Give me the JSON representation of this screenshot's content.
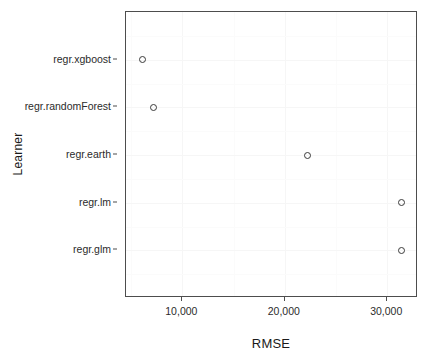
{
  "chart_data": {
    "type": "scatter",
    "title": "",
    "xlabel": "RMSE",
    "ylabel": "Learner",
    "grid": true,
    "legend": null,
    "xlim": [
      4500,
      33000
    ],
    "x_ticks": [
      10000,
      20000,
      30000
    ],
    "x_tick_labels": [
      "10,000",
      "20,000",
      "30,000"
    ],
    "y_categories": [
      "regr.glm",
      "regr.lm",
      "regr.earth",
      "regr.randomForest",
      "regr.xgboost"
    ],
    "points": [
      {
        "learner": "regr.xgboost",
        "rmse": 6100
      },
      {
        "learner": "regr.randomForest",
        "rmse": 7150
      },
      {
        "learner": "regr.earth",
        "rmse": 22200
      },
      {
        "learner": "regr.lm",
        "rmse": 31400
      },
      {
        "learner": "regr.glm",
        "rmse": 31400
      }
    ],
    "marker": "open-circle",
    "marker_color": "#3a3a3a",
    "panel_background": "#ffffff",
    "grid_color": "#f6f6f6",
    "border_color": "#4d4d4d"
  },
  "axes": {
    "x_title": "RMSE",
    "y_title": "Learner",
    "x_tick_labels": [
      "10,000",
      "20,000",
      "30,000"
    ],
    "y_tick_labels": [
      "regr.xgboost",
      "regr.randomForest",
      "regr.earth",
      "regr.lm",
      "regr.glm"
    ]
  }
}
